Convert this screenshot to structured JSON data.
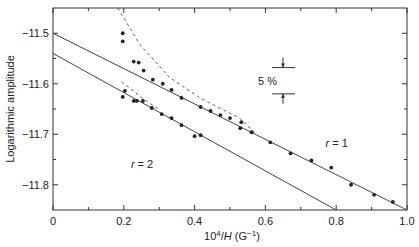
{
  "chart_data": {
    "type": "scatter",
    "title": "",
    "xlabel": "10^4/H (G^-1)",
    "xlabel_parts": {
      "base": "10",
      "exp": "4",
      "slash": "/",
      "var": "H",
      "unit": " (G",
      "unit_exp": "−1",
      "close": ")"
    },
    "ylabel": "Logarithmic amplitude",
    "xlim": [
      0,
      1.0
    ],
    "ylim": [
      -11.85,
      -11.45
    ],
    "grid": false,
    "x_ticks": [
      {
        "value": 0,
        "label": "0"
      },
      {
        "value": 0.2,
        "label": "0.2"
      },
      {
        "value": 0.4,
        "label": "0.4"
      },
      {
        "value": 0.6,
        "label": "0.6"
      },
      {
        "value": 0.8,
        "label": "0.8"
      },
      {
        "value": 1.0,
        "label": "1.0"
      }
    ],
    "x_minor_ticks": [
      0.1,
      0.3,
      0.5,
      0.7,
      0.9
    ],
    "y_ticks": [
      {
        "value": -11.5,
        "label": "−11.5"
      },
      {
        "value": -11.6,
        "label": "−11.6"
      },
      {
        "value": -11.7,
        "label": "−11.7"
      },
      {
        "value": -11.8,
        "label": "−11.8"
      }
    ],
    "y_minor_ticks": [
      -11.55,
      -11.65,
      -11.75
    ],
    "series": [
      {
        "name": "r = 1",
        "kind": "points",
        "points": [
          [
            0.197,
            -11.5
          ],
          [
            0.197,
            -11.516
          ],
          [
            0.228,
            -11.556
          ],
          [
            0.242,
            -11.558
          ],
          [
            0.256,
            -11.574
          ],
          [
            0.282,
            -11.592
          ],
          [
            0.31,
            -11.6
          ],
          [
            0.335,
            -11.612
          ],
          [
            0.363,
            -11.628
          ],
          [
            0.417,
            -11.646
          ],
          [
            0.445,
            -11.654
          ],
          [
            0.473,
            -11.662
          ],
          [
            0.5,
            -11.668
          ],
          [
            0.532,
            -11.676
          ],
          [
            0.529,
            -11.688
          ],
          [
            0.561,
            -11.696
          ],
          [
            0.614,
            -11.716
          ],
          [
            0.671,
            -11.738
          ],
          [
            0.73,
            -11.752
          ],
          [
            0.786,
            -11.766
          ],
          [
            0.842,
            -11.8
          ],
          [
            0.907,
            -11.82
          ],
          [
            0.96,
            -11.834
          ]
        ]
      },
      {
        "name": "r = 2",
        "kind": "points",
        "points": [
          [
            0.203,
            -11.614
          ],
          [
            0.197,
            -11.626
          ],
          [
            0.228,
            -11.634
          ],
          [
            0.237,
            -11.634
          ],
          [
            0.254,
            -11.634
          ],
          [
            0.279,
            -11.648
          ],
          [
            0.307,
            -11.66
          ],
          [
            0.335,
            -11.668
          ],
          [
            0.363,
            -11.682
          ],
          [
            0.4,
            -11.704
          ],
          [
            0.417,
            -11.702
          ]
        ]
      }
    ],
    "fit_lines": [
      {
        "name": "r = 1 fit",
        "style": "solid",
        "from": [
          0,
          -11.5
        ],
        "to": [
          1.0,
          -11.85
        ]
      },
      {
        "name": "r = 2 fit",
        "style": "solid",
        "from": [
          0,
          -11.54
        ],
        "to": [
          0.8,
          -11.85
        ]
      }
    ],
    "dashed_curves": [
      {
        "name": "r = 1 curve",
        "points": [
          [
            0.183,
            -11.45
          ],
          [
            0.245,
            -11.522
          ],
          [
            0.33,
            -11.588
          ],
          [
            0.415,
            -11.628
          ],
          [
            0.527,
            -11.668
          ],
          [
            0.569,
            -11.696
          ]
        ]
      },
      {
        "name": "r = 2 curve",
        "points": [
          [
            0.194,
            -11.596
          ],
          [
            0.259,
            -11.632
          ],
          [
            0.302,
            -11.652
          ]
        ]
      }
    ],
    "annotations": [
      {
        "text": "r = 1",
        "x": 0.77,
        "y": -11.726
      },
      {
        "text": "r = 2",
        "x": 0.22,
        "y": -11.766
      },
      {
        "text": "5 %",
        "x": 0.6,
        "y": -11.592,
        "kind": "scale-bar",
        "bar_top": -11.568,
        "bar_bottom": -11.62
      }
    ]
  },
  "labels": {
    "y_axis_title": "Logarithmic amplitude",
    "scale_label": "5 %",
    "r1_label": "r = 1",
    "r2_label": "r = 2"
  }
}
